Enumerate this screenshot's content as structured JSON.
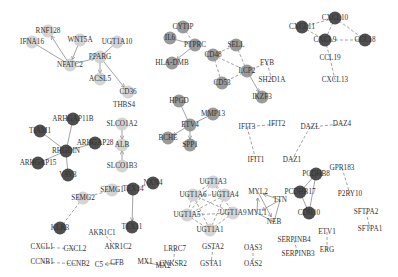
{
  "node_colors": {
    "light": "#cfcfcf",
    "gray": "#8f8f8f",
    "dark": "#3c3c3c",
    "none": "none"
  },
  "nodes": [
    {
      "id": "RNF128",
      "x": 48,
      "y": 31,
      "c": "light"
    },
    {
      "id": "IFNA16",
      "x": 32,
      "y": 42,
      "c": "light"
    },
    {
      "id": "WNT5A",
      "x": 80,
      "y": 40,
      "c": "light"
    },
    {
      "id": "NFATC2",
      "x": 70,
      "y": 65,
      "c": "light"
    },
    {
      "id": "UGT1A10",
      "x": 117,
      "y": 42,
      "c": "light"
    },
    {
      "id": "PPARG",
      "x": 100,
      "y": 57,
      "c": "light"
    },
    {
      "id": "ACSL5",
      "x": 100,
      "y": 79,
      "c": "light"
    },
    {
      "id": "CD36",
      "x": 128,
      "y": 92,
      "c": "light"
    },
    {
      "id": "THBS4",
      "x": 124,
      "y": 105,
      "c": "none"
    },
    {
      "id": "CYTIP",
      "x": 183,
      "y": 27,
      "c": "gray"
    },
    {
      "id": "IL6",
      "x": 170,
      "y": 38,
      "c": "gray"
    },
    {
      "id": "PTPRC",
      "x": 195,
      "y": 45,
      "c": "gray"
    },
    {
      "id": "HLA-DMB",
      "x": 172,
      "y": 63,
      "c": "gray"
    },
    {
      "id": "CD48",
      "x": 213,
      "y": 55,
      "c": "gray"
    },
    {
      "id": "SELL",
      "x": 236,
      "y": 45,
      "c": "gray"
    },
    {
      "id": "LCP2",
      "x": 247,
      "y": 71,
      "c": "gray"
    },
    {
      "id": "FYB",
      "x": 267,
      "y": 63,
      "c": "none"
    },
    {
      "id": "SH2D1A",
      "x": 272,
      "y": 80,
      "c": "none"
    },
    {
      "id": "CD53",
      "x": 222,
      "y": 83,
      "c": "gray"
    },
    {
      "id": "IKZF3",
      "x": 262,
      "y": 97,
      "c": "gray"
    },
    {
      "id": "CXCL10",
      "x": 335,
      "y": 18,
      "c": "dark"
    },
    {
      "id": "CXCL11",
      "x": 302,
      "y": 27,
      "c": "dark"
    },
    {
      "id": "CXCL9",
      "x": 325,
      "y": 40,
      "c": "dark"
    },
    {
      "id": "CCL18",
      "x": 365,
      "y": 40,
      "c": "dark"
    },
    {
      "id": "CCL19",
      "x": 330,
      "y": 58,
      "c": "none"
    },
    {
      "id": "CXCL13",
      "x": 335,
      "y": 80,
      "c": "none"
    },
    {
      "id": "ARHGAP11B",
      "x": 73,
      "y": 119,
      "c": "dark"
    },
    {
      "id": "TIAM1",
      "x": 40,
      "y": 131,
      "c": "dark"
    },
    {
      "id": "RHGDIN",
      "x": 66,
      "y": 151,
      "c": "dark"
    },
    {
      "id": "ARHGAP28",
      "x": 95,
      "y": 143,
      "c": "dark"
    },
    {
      "id": "ARHGAP15",
      "x": 38,
      "y": 163,
      "c": "dark"
    },
    {
      "id": "VAV3",
      "x": 68,
      "y": 175,
      "c": "dark"
    },
    {
      "id": "SLCO1A2",
      "x": 122,
      "y": 124,
      "c": "light"
    },
    {
      "id": "ALB",
      "x": 122,
      "y": 145,
      "c": "light"
    },
    {
      "id": "SLCO1B3",
      "x": 122,
      "y": 166,
      "c": "light"
    },
    {
      "id": "HPGD",
      "x": 179,
      "y": 101,
      "c": "gray"
    },
    {
      "id": "ETV4",
      "x": 190,
      "y": 125,
      "c": "gray"
    },
    {
      "id": "MMP13",
      "x": 213,
      "y": 114,
      "c": "gray"
    },
    {
      "id": "BCHE",
      "x": 168,
      "y": 138,
      "c": "gray"
    },
    {
      "id": "SPP1",
      "x": 190,
      "y": 145,
      "c": "gray"
    },
    {
      "id": "IFIT3",
      "x": 247,
      "y": 127,
      "c": "none"
    },
    {
      "id": "IFIT2",
      "x": 277,
      "y": 124,
      "c": "none"
    },
    {
      "id": "IFIT1",
      "x": 256,
      "y": 160,
      "c": "none"
    },
    {
      "id": "DAZL",
      "x": 310,
      "y": 127,
      "c": "none"
    },
    {
      "id": "DAZ4",
      "x": 342,
      "y": 124,
      "c": "none"
    },
    {
      "id": "DAZ1",
      "x": 292,
      "y": 160,
      "c": "none"
    },
    {
      "id": "PCDHB8",
      "x": 316,
      "y": 174,
      "c": "dark"
    },
    {
      "id": "PCDHB17",
      "x": 300,
      "y": 192,
      "c": "dark"
    },
    {
      "id": "CDH10",
      "x": 309,
      "y": 213,
      "c": "dark"
    },
    {
      "id": "GPR183",
      "x": 342,
      "y": 168,
      "c": "none"
    },
    {
      "id": "P2RY10",
      "x": 350,
      "y": 194,
      "c": "none"
    },
    {
      "id": "SFTPA2",
      "x": 366,
      "y": 212,
      "c": "none"
    },
    {
      "id": "SFTPA1",
      "x": 370,
      "y": 229,
      "c": "none"
    },
    {
      "id": "SEMG2",
      "x": 83,
      "y": 198,
      "c": "light"
    },
    {
      "id": "SEMG1",
      "x": 112,
      "y": 190,
      "c": "light"
    },
    {
      "id": "KLK3",
      "x": 60,
      "y": 228,
      "c": "dark"
    },
    {
      "id": "TEX14",
      "x": 133,
      "y": 189,
      "c": "dark"
    },
    {
      "id": "NXN4",
      "x": 153,
      "y": 183,
      "c": "dark"
    },
    {
      "id": "TEX11",
      "x": 132,
      "y": 227,
      "c": "dark"
    },
    {
      "id": "AKR1C1",
      "x": 102,
      "y": 233,
      "c": "none"
    },
    {
      "id": "AKR1C2",
      "x": 118,
      "y": 247,
      "c": "none"
    },
    {
      "id": "CXCL1",
      "x": 42,
      "y": 247,
      "c": "none"
    },
    {
      "id": "CXCL2",
      "x": 75,
      "y": 249,
      "c": "none"
    },
    {
      "id": "CCNB1",
      "x": 42,
      "y": 262,
      "c": "none"
    },
    {
      "id": "CCNB2",
      "x": 78,
      "y": 264,
      "c": "none"
    },
    {
      "id": "C5",
      "x": 99,
      "y": 265,
      "c": "none"
    },
    {
      "id": "CFB",
      "x": 117,
      "y": 263,
      "c": "none"
    },
    {
      "id": "MX1",
      "x": 145,
      "y": 262,
      "c": "none"
    },
    {
      "id": "MX2",
      "x": 163,
      "y": 266,
      "c": "none"
    },
    {
      "id": "UGT1A3",
      "x": 213,
      "y": 182,
      "c": "light"
    },
    {
      "id": "UGT1A6",
      "x": 193,
      "y": 195,
      "c": "light"
    },
    {
      "id": "UGT1A4",
      "x": 225,
      "y": 195,
      "c": "light"
    },
    {
      "id": "UGT1A5",
      "x": 187,
      "y": 215,
      "c": "light"
    },
    {
      "id": "UGT1A9",
      "x": 233,
      "y": 213,
      "c": "light"
    },
    {
      "id": "UGT1A1",
      "x": 210,
      "y": 230,
      "c": "light"
    },
    {
      "id": "MYL2",
      "x": 258,
      "y": 192,
      "c": "none"
    },
    {
      "id": "TTN",
      "x": 280,
      "y": 200,
      "c": "none"
    },
    {
      "id": "MYL1",
      "x": 257,
      "y": 213,
      "c": "none"
    },
    {
      "id": "NEB",
      "x": 274,
      "y": 222,
      "c": "none"
    },
    {
      "id": "LRRC7",
      "x": 175,
      "y": 249,
      "c": "none"
    },
    {
      "id": "CNKSR2",
      "x": 173,
      "y": 264,
      "c": "none"
    },
    {
      "id": "GSTA2",
      "x": 213,
      "y": 247,
      "c": "none"
    },
    {
      "id": "GSTA1",
      "x": 211,
      "y": 264,
      "c": "none"
    },
    {
      "id": "OAS3",
      "x": 253,
      "y": 248,
      "c": "none"
    },
    {
      "id": "OAS2",
      "x": 253,
      "y": 264,
      "c": "none"
    },
    {
      "id": "SERPINB4",
      "x": 294,
      "y": 240,
      "c": "none"
    },
    {
      "id": "SERPINB3",
      "x": 298,
      "y": 254,
      "c": "none"
    },
    {
      "id": "ETV1",
      "x": 327,
      "y": 232,
      "c": "none"
    },
    {
      "id": "ERG",
      "x": 327,
      "y": 250,
      "c": "none"
    }
  ],
  "edges": [
    {
      "s": "NFATC2",
      "t": "RNF128",
      "d": false,
      "a": true
    },
    {
      "s": "IFNA16",
      "t": "NFATC2",
      "d": false,
      "a": false
    },
    {
      "s": "WNT5A",
      "t": "NFATC2",
      "d": false,
      "a": true
    },
    {
      "s": "NFATC2",
      "t": "PPARG",
      "d": false,
      "a": true
    },
    {
      "s": "PPARG",
      "t": "UGT1A10",
      "d": false,
      "a": false
    },
    {
      "s": "PPARG",
      "t": "ACSL5",
      "d": false,
      "a": true
    },
    {
      "s": "PPARG",
      "t": "CD36",
      "d": false,
      "a": true
    },
    {
      "s": "CYTIP",
      "t": "PTPRC",
      "d": true,
      "a": false
    },
    {
      "s": "IL6",
      "t": "PTPRC",
      "d": false,
      "a": false
    },
    {
      "s": "PTPRC",
      "t": "HLA-DMB",
      "d": false,
      "a": true
    },
    {
      "s": "CD48",
      "t": "SELL",
      "d": true,
      "a": false
    },
    {
      "s": "CD48",
      "t": "LCP2",
      "d": true,
      "a": false
    },
    {
      "s": "CD48",
      "t": "CD53",
      "d": true,
      "a": false
    },
    {
      "s": "SELL",
      "t": "LCP2",
      "d": true,
      "a": false
    },
    {
      "s": "CD53",
      "t": "LCP2",
      "d": true,
      "a": false
    },
    {
      "s": "LCP2",
      "t": "FYB",
      "d": true,
      "a": false
    },
    {
      "s": "FYB",
      "t": "SH2D1A",
      "d": true,
      "a": false
    },
    {
      "s": "LCP2",
      "t": "IKZF3",
      "d": false,
      "a": true
    },
    {
      "s": "CXCL11",
      "t": "CXCL10",
      "d": true,
      "a": false
    },
    {
      "s": "CXCL11",
      "t": "CXCL9",
      "d": true,
      "a": false
    },
    {
      "s": "CXCL10",
      "t": "CXCL9",
      "d": true,
      "a": false
    },
    {
      "s": "CXCL10",
      "t": "CCL18",
      "d": true,
      "a": false
    },
    {
      "s": "CXCL9",
      "t": "CCL18",
      "d": true,
      "a": false
    },
    {
      "s": "CXCL9",
      "t": "CCL19",
      "d": true,
      "a": false
    },
    {
      "s": "CCL19",
      "t": "CXCL13",
      "d": true,
      "a": false
    },
    {
      "s": "ARHGAP11B",
      "t": "RHGDIN",
      "d": false,
      "a": false
    },
    {
      "s": "TIAM1",
      "t": "RHGDIN",
      "d": false,
      "a": false
    },
    {
      "s": "ARHGAP28",
      "t": "RHGDIN",
      "d": false,
      "a": false
    },
    {
      "s": "ARHGAP15",
      "t": "RHGDIN",
      "d": false,
      "a": false
    },
    {
      "s": "VAV3",
      "t": "RHGDIN",
      "d": false,
      "a": false
    },
    {
      "s": "SLCO1A2",
      "t": "ALB",
      "d": false,
      "a": true
    },
    {
      "s": "SLCO1B3",
      "t": "ALB",
      "d": false,
      "a": true
    },
    {
      "s": "HPGD",
      "t": "ETV4",
      "d": false,
      "a": false
    },
    {
      "s": "MMP13",
      "t": "ETV4",
      "d": false,
      "a": false
    },
    {
      "s": "ETV4",
      "t": "BCHE",
      "d": false,
      "a": true
    },
    {
      "s": "ETV4",
      "t": "SPP1",
      "d": false,
      "a": true
    },
    {
      "s": "IFIT3",
      "t": "IFIT2",
      "d": true,
      "a": false
    },
    {
      "s": "IFIT3",
      "t": "IFIT1",
      "d": true,
      "a": false
    },
    {
      "s": "DAZL",
      "t": "DAZ4",
      "d": true,
      "a": false
    },
    {
      "s": "DAZL",
      "t": "DAZ1",
      "d": true,
      "a": false
    },
    {
      "s": "PCDHB8",
      "t": "PCDHB17",
      "d": false,
      "a": false
    },
    {
      "s": "PCDHB8",
      "t": "CDH10",
      "d": false,
      "a": false
    },
    {
      "s": "PCDHB17",
      "t": "CDH10",
      "d": false,
      "a": false
    },
    {
      "s": "GPR183",
      "t": "P2RY10",
      "d": true,
      "a": false
    },
    {
      "s": "SFTPA2",
      "t": "SFTPA1",
      "d": true,
      "a": false
    },
    {
      "s": "SEMG1",
      "t": "SEMG2",
      "d": true,
      "a": false
    },
    {
      "s": "SEMG2",
      "t": "KLK3",
      "d": true,
      "a": false
    },
    {
      "s": "TEX14",
      "t": "NXN4",
      "d": true,
      "a": false
    },
    {
      "s": "TEX14",
      "t": "TEX11",
      "d": false,
      "a": true
    },
    {
      "s": "AKR1C1",
      "t": "AKR1C2",
      "d": true,
      "a": false
    },
    {
      "s": "CXCL1",
      "t": "CXCL2",
      "d": true,
      "a": false
    },
    {
      "s": "CCNB1",
      "t": "CCNB2",
      "d": true,
      "a": false
    },
    {
      "s": "CFB",
      "t": "C5",
      "d": false,
      "a": true
    },
    {
      "s": "MX1",
      "t": "MX2",
      "d": false,
      "a": false
    },
    {
      "s": "UGT1A3",
      "t": "UGT1A6",
      "d": true,
      "a": false
    },
    {
      "s": "UGT1A3",
      "t": "UGT1A4",
      "d": true,
      "a": false
    },
    {
      "s": "UGT1A3",
      "t": "UGT1A5",
      "d": true,
      "a": false
    },
    {
      "s": "UGT1A3",
      "t": "UGT1A9",
      "d": true,
      "a": false
    },
    {
      "s": "UGT1A6",
      "t": "UGT1A4",
      "d": true,
      "a": false
    },
    {
      "s": "UGT1A6",
      "t": "UGT1A5",
      "d": true,
      "a": false
    },
    {
      "s": "UGT1A6",
      "t": "UGT1A9",
      "d": true,
      "a": false
    },
    {
      "s": "UGT1A6",
      "t": "UGT1A1",
      "d": true,
      "a": false
    },
    {
      "s": "UGT1A4",
      "t": "UGT1A5",
      "d": true,
      "a": false
    },
    {
      "s": "UGT1A4",
      "t": "UGT1A1",
      "d": true,
      "a": false
    },
    {
      "s": "UGT1A5",
      "t": "UGT1A9",
      "d": true,
      "a": false
    },
    {
      "s": "UGT1A5",
      "t": "UGT1A1",
      "d": true,
      "a": false
    },
    {
      "s": "UGT1A9",
      "t": "UGT1A1",
      "d": true,
      "a": false
    },
    {
      "s": "MYL1",
      "t": "MYL2",
      "d": false,
      "a": true
    },
    {
      "s": "TTN",
      "t": "MYL2",
      "d": false,
      "a": true
    },
    {
      "s": "TTN",
      "t": "MYL1",
      "d": false,
      "a": true
    },
    {
      "s": "MYL2",
      "t": "NEB",
      "d": false,
      "a": true
    },
    {
      "s": "TTN",
      "t": "NEB",
      "d": false,
      "a": false
    },
    {
      "s": "MYL1",
      "t": "NEB",
      "d": false,
      "a": false
    },
    {
      "s": "LRRC7",
      "t": "CNKSR2",
      "d": true,
      "a": false
    },
    {
      "s": "GSTA2",
      "t": "GSTA1",
      "d": true,
      "a": false
    },
    {
      "s": "OAS3",
      "t": "OAS2",
      "d": true,
      "a": false
    },
    {
      "s": "SERPINB4",
      "t": "SERPINB3",
      "d": true,
      "a": false
    },
    {
      "s": "ETV1",
      "t": "ERG",
      "d": true,
      "a": false
    }
  ]
}
